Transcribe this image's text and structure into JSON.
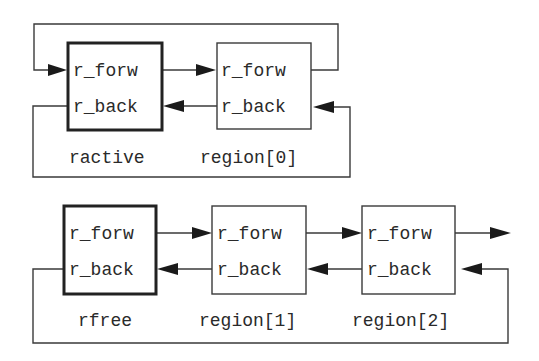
{
  "diagram": {
    "top_list": {
      "nodes": [
        {
          "name": "ractive",
          "field_forw": "r_forw",
          "field_back": "r_back",
          "head": true
        },
        {
          "name": "region[0]",
          "field_forw": "r_forw",
          "field_back": "r_back",
          "head": false
        }
      ]
    },
    "bottom_list": {
      "nodes": [
        {
          "name": "rfree",
          "field_forw": "r_forw",
          "field_back": "r_back",
          "head": true
        },
        {
          "name": "region[1]",
          "field_forw": "r_forw",
          "field_back": "r_back",
          "head": false
        },
        {
          "name": "region[2]",
          "field_forw": "r_forw",
          "field_back": "r_back",
          "head": false
        }
      ]
    },
    "colors": {
      "stroke": "#3a3a3a",
      "text": "#2a2a2a",
      "background": "#ffffff"
    }
  }
}
